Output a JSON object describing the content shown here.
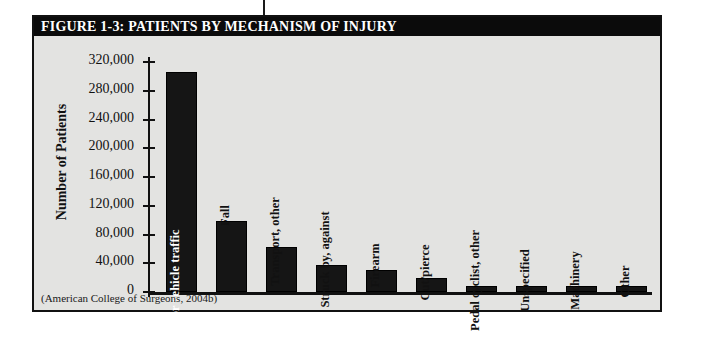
{
  "figure": {
    "caption": "FIGURE 1-3: PATIENTS BY MECHANISM OF INJURY",
    "source_note": "(American College of Surgeons, 2004b)",
    "caption_bar_color": "#0b0b0b",
    "panel_color": "#e3e3e1",
    "bar_color": "#151515"
  },
  "chart_data": {
    "type": "bar",
    "title": "FIGURE 1-3: PATIENTS BY MECHANISM OF INJURY",
    "xlabel": "",
    "ylabel": "Number of Patients",
    "ylim": [
      0,
      320000
    ],
    "ytick_step": 40000,
    "yticks": [
      320000,
      280000,
      240000,
      200000,
      160000,
      120000,
      80000,
      40000,
      0
    ],
    "ytick_labels": [
      "320,000",
      "280,000",
      "240,000",
      "200,000",
      "160,000",
      "120,000",
      "80,000",
      "40,000",
      "0"
    ],
    "grid": false,
    "legend": false,
    "orientation": "vertical",
    "categories": [
      "Motor vehicle traffic",
      "Fall",
      "Transport, other",
      "Struck by, against",
      "Firearm",
      "Cut/pierce",
      "Pedal cyclist, other",
      "Unspecified",
      "Machinery",
      "Other"
    ],
    "values": [
      306000,
      99000,
      63000,
      38000,
      30000,
      20000,
      9000,
      9000,
      9000,
      8000
    ],
    "source": "(American College of Surgeons, 2004b)"
  }
}
